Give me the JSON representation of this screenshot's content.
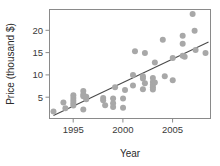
{
  "chart_data": {
    "type": "scatter",
    "title": "",
    "subtitle": "",
    "xlabel": "Year",
    "ylabel": "Price (thousand $)",
    "xlim": [
      1992.6,
      2008.8
    ],
    "ylim": [
      0.0,
      24.5
    ],
    "xticks": [
      1995,
      2000,
      2005
    ],
    "xticklabels": [
      "1995",
      "2000",
      "2005"
    ],
    "yticks": [
      5,
      10,
      15,
      20
    ],
    "yticklabels": [
      "5",
      "10",
      "15",
      "20"
    ],
    "grid": false,
    "legend": null,
    "point_color": "#a8a8a8",
    "line_color": "#4a4a4a",
    "frame_color": "#8a8a8a",
    "marker": "circle",
    "marker_size": 3.0,
    "x": [
      1993.0,
      1994.0,
      1994.2,
      1995.0,
      1995.0,
      1995.0,
      1995.0,
      1995.0,
      1996.0,
      1996.0,
      1996.0,
      1996.0,
      1996.3,
      1996.3,
      1998.0,
      1998.0,
      1998.2,
      1999.0,
      1999.0,
      1999.0,
      1999.2,
      2000.0,
      2000.0,
      2000.2,
      2001.0,
      2001.0,
      2001.2,
      2002.0,
      2002.0,
      2002.0,
      2002.2,
      2002.2,
      2003.0,
      2003.0,
      2003.0,
      2003.0,
      2003.0,
      2003.2,
      2003.2,
      2004.0,
      2004.2,
      2005.0,
      2005.0,
      2006.0,
      2006.0,
      2006.0,
      2006.2,
      2007.0,
      2007.2,
      2007.3,
      2008.3
    ],
    "y": [
      1.6,
      3.6,
      2.3,
      5.2,
      4.6,
      4.0,
      3.4,
      2.9,
      6.2,
      5.4,
      5.0,
      2.0,
      4.9,
      4.3,
      4.6,
      4.1,
      3.0,
      4.5,
      3.4,
      2.6,
      7.0,
      4.5,
      2.4,
      6.4,
      9.8,
      7.4,
      15.1,
      9.5,
      9.0,
      6.6,
      14.7,
      7.9,
      8.2,
      7.6,
      7.0,
      6.5,
      9.1,
      12.6,
      8.1,
      17.7,
      9.5,
      13.6,
      8.6,
      18.6,
      16.8,
      14.1,
      13.9,
      23.5,
      19.7,
      15.4,
      14.7
    ],
    "fit_line": {
      "x": [
        1993.0,
        2008.6
      ],
      "y": [
        0.7,
        17.2
      ]
    }
  }
}
